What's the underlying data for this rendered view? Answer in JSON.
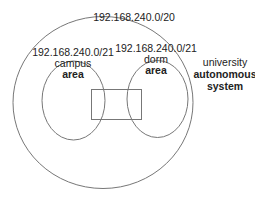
{
  "diagram": {
    "outer": {
      "label": "192.168.240.0/20",
      "side_label": {
        "line1": "university",
        "line2": "autonomous",
        "line3": "system"
      }
    },
    "left_area": {
      "prefix": "192.168.240.0/21",
      "name": "campus",
      "kind": "area"
    },
    "right_area": {
      "prefix": "192.168.240.0/21",
      "name": "dorm",
      "kind": "area"
    },
    "stroke_color": "#777777",
    "text_color": "#222222"
  }
}
